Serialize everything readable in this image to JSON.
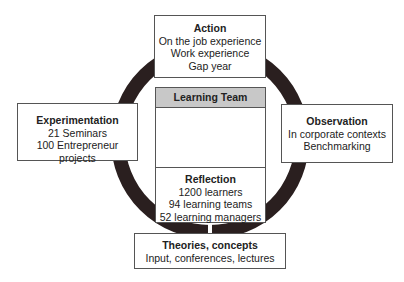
{
  "learning_team": {
    "title": "Learning Team"
  },
  "action": {
    "title": "Action",
    "lines": [
      "On the job experience",
      "Work experience",
      "Gap year"
    ]
  },
  "experimentation": {
    "title": "Experimentation",
    "lines": [
      "21 Seminars",
      "100 Entrepreneur projects"
    ]
  },
  "observation": {
    "title": "Observation",
    "lines": [
      "In corporate contexts",
      "Benchmarking"
    ]
  },
  "reflection": {
    "title": "Reflection",
    "lines": [
      "1200 learners",
      "94 learning teams",
      "52 learning managers"
    ]
  },
  "theories": {
    "title": "Theories, concepts",
    "lines": [
      "Input, conferences, lectures"
    ]
  },
  "colors": {
    "ring": "#2a1f1f",
    "header": "#c8c8c8"
  }
}
